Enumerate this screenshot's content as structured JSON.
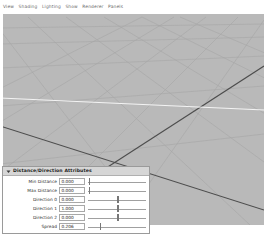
{
  "menubar": {
    "items": [
      {
        "label": "View"
      },
      {
        "label": "Shading"
      },
      {
        "label": "Lighting"
      },
      {
        "label": "Show"
      },
      {
        "label": "Renderer"
      },
      {
        "label": "Panels"
      }
    ]
  },
  "viewport": {
    "background_color": "#b9b9b9",
    "grid_line_color": "#a8a8a8",
    "dark_line_color": "#4a4a4a",
    "highlight_line_color": "#f2f2f2"
  },
  "panel": {
    "title": "Distance/Direction Attributes",
    "collapsed": false,
    "disclosure_icon": "triangle-down-icon",
    "rows": [
      {
        "label": "Min Distance",
        "value": "0.000",
        "slider_percent": 1
      },
      {
        "label": "Max Distance",
        "value": "0.000",
        "slider_percent": 1
      },
      {
        "label": "Direction 0",
        "value": "0.000",
        "slider_percent": 50
      },
      {
        "label": "Direction 1",
        "value": "1.000",
        "slider_percent": 50
      },
      {
        "label": "Direction 2",
        "value": "0.000",
        "slider_percent": 50
      },
      {
        "label": "Spread",
        "value": "0.206",
        "slider_percent": 20
      }
    ]
  }
}
